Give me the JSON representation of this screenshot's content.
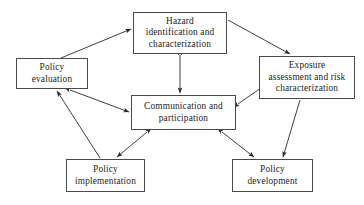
{
  "diagram": {
    "type": "flow-diagram",
    "background_color": "#ffffff",
    "box_border_color": "#4a4a4a",
    "arrow_color": "#2b2b2b",
    "text_color": "#1c1c1c",
    "nodes": [
      {
        "id": "hazard",
        "label": "Hazard\nidentification and\ncharacterization",
        "x": 133,
        "y": 12,
        "w": 94,
        "h": 42
      },
      {
        "id": "policy_evaluation",
        "label": "Policy\nevaluation",
        "x": 16,
        "y": 58,
        "w": 72,
        "h": 31
      },
      {
        "id": "exposure",
        "label": "Exposure\nassessment and risk\ncharacterization",
        "x": 259,
        "y": 56,
        "w": 96,
        "h": 43
      },
      {
        "id": "communication",
        "label": "Communication and\nparticipation",
        "x": 131,
        "y": 95,
        "w": 105,
        "h": 35
      },
      {
        "id": "policy_implementation",
        "label": "Policy\nimplementation",
        "x": 66,
        "y": 159,
        "w": 79,
        "h": 33
      },
      {
        "id": "policy_development",
        "label": "Policy\ndevelopment",
        "x": 232,
        "y": 159,
        "w": 81,
        "h": 33
      }
    ],
    "edges": [
      {
        "id": "evaluation-to-hazard",
        "from": "policy_evaluation",
        "to": "hazard",
        "heads": "single",
        "x1": 61,
        "y1": 58,
        "x2": 131,
        "y2": 29
      },
      {
        "id": "hazard-to-exposure",
        "from": "hazard",
        "to": "exposure",
        "heads": "single",
        "x1": 228,
        "y1": 20,
        "x2": 290,
        "y2": 54
      },
      {
        "id": "hazard-communication",
        "from": "hazard",
        "to": "communication",
        "heads": "double",
        "x1": 180,
        "y1": 55,
        "x2": 180,
        "y2": 93
      },
      {
        "id": "evaluation-communication",
        "from": "policy_evaluation",
        "to": "communication",
        "heads": "double",
        "x1": 70,
        "y1": 90,
        "x2": 129,
        "y2": 112
      },
      {
        "id": "communication-exposure",
        "from": "communication",
        "to": "exposure",
        "heads": "double",
        "x1": 238,
        "y1": 104,
        "x2": 281,
        "y2": 74
      },
      {
        "id": "implementation-to-evaluation",
        "from": "policy_implementation",
        "to": "policy_evaluation",
        "heads": "single",
        "x1": 100,
        "y1": 158,
        "x2": 57,
        "y2": 91
      },
      {
        "id": "communication-implementation",
        "from": "communication",
        "to": "policy_implementation",
        "heads": "double",
        "x1": 147,
        "y1": 132,
        "x2": 117,
        "y2": 157
      },
      {
        "id": "communication-development",
        "from": "communication",
        "to": "policy_development",
        "heads": "double",
        "x1": 222,
        "y1": 132,
        "x2": 254,
        "y2": 157
      },
      {
        "id": "exposure-to-development",
        "from": "exposure",
        "to": "policy_development",
        "heads": "single",
        "x1": 300,
        "y1": 100,
        "x2": 283,
        "y2": 157
      }
    ]
  }
}
